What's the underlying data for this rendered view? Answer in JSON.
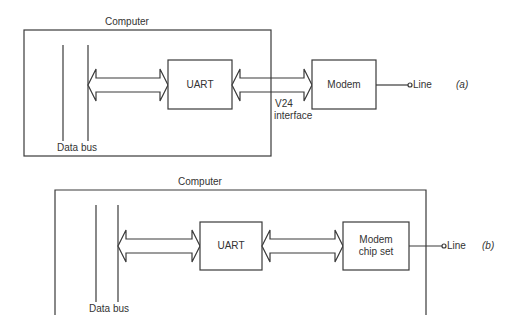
{
  "diagram_a": {
    "container_label": "Computer",
    "bus_label": "Data bus",
    "uart_label": "UART",
    "modem_label": "Modem",
    "interface_label_line1": "V24",
    "interface_label_line2": "interface",
    "line_label": "Line",
    "figure_tag": "(a)"
  },
  "diagram_b": {
    "container_label": "Computer",
    "bus_label": "Data bus",
    "uart_label": "UART",
    "modem_label_line1": "Modem",
    "modem_label_line2": "chip set",
    "line_label": "Line",
    "figure_tag": "(b)"
  },
  "colors": {
    "stroke": "#3a3a3a",
    "background": "#ffffff"
  }
}
